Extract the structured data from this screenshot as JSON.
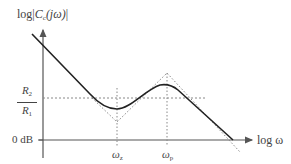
{
  "diagram": {
    "y_axis_label": {
      "prefix": "log|",
      "var": "C",
      "sub": "c",
      "arg": "(jω)",
      "suffix": "|"
    },
    "x_axis_label": "log ω",
    "level_label": {
      "numerator_var": "R",
      "numerator_sub": "2",
      "denominator_var": "R",
      "denominator_sub": "1"
    },
    "zero_db_label": "0 dB",
    "markers": [
      {
        "var": "ω",
        "sub": "z"
      },
      {
        "var": "ω",
        "sub": "p"
      }
    ],
    "colors": {
      "curve": "#222222",
      "axis": "#555555",
      "dotted": "#777777"
    }
  }
}
